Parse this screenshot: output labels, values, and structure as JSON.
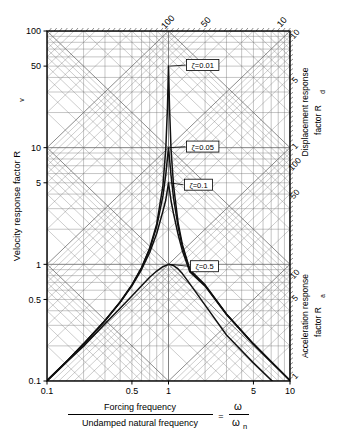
{
  "chart_data": {
    "type": "line",
    "title": "",
    "plot_kind": "tripartite-four-way-logarithmic-response-spectrum",
    "xlabel_numerator": "Forcing frequency",
    "xlabel_denominator": "Undamped  natural  frequency",
    "xlabel_equals": "=",
    "xlabel_ratio_num": "ω",
    "xlabel_ratio_den": "ω",
    "xlabel_ratio_den_sub": "n",
    "ylabel_left": "Velocity  response  factor  R",
    "ylabel_left_sub": "v",
    "ylabel_right_top": "Displacement  response",
    "ylabel_right_top2": "factor  R",
    "ylabel_right_top_sub": "d",
    "ylabel_right_bottom": "Acceleration  response",
    "ylabel_right_bottom2": "factor  R",
    "ylabel_right_bottom_sub": "a",
    "xlim": [
      0.1,
      10
    ],
    "ylim": [
      0.1,
      100
    ],
    "xscale": "log",
    "yscale": "log",
    "xticks": [
      "0.1",
      "0.5",
      "1",
      "5",
      "10"
    ],
    "xtick_values": [
      0.1,
      0.5,
      1,
      5,
      10
    ],
    "yticks": [
      "0.1",
      "0.5",
      "1",
      "5",
      "10",
      "50",
      "100"
    ],
    "ytick_values": [
      0.1,
      0.5,
      1,
      5,
      10,
      50,
      100
    ],
    "top_axis_ticks": [
      "100",
      "50",
      "10"
    ],
    "top_axis_tick_values": [
      100,
      50,
      10
    ],
    "right_axis_upper_ticks": [
      "10",
      "5",
      "1"
    ],
    "right_axis_upper_tick_values": [
      10,
      5,
      1
    ],
    "right_axis_mid_ticks": [
      "100",
      "50"
    ],
    "right_axis_mid_tick_values": [
      100,
      50
    ],
    "right_axis_lower_ticks": [
      "10",
      "5",
      "1"
    ],
    "right_axis_lower_tick_values": [
      10,
      5,
      1
    ],
    "grid": true,
    "grid_style": "four-way-logarithmic (horizontal, vertical, +45 and -45 diagonals)",
    "legend_position": "inline-annotations",
    "annotations": [
      {
        "text": "ζ=0.01",
        "x": 1.0,
        "y": 50
      },
      {
        "text": "ζ=0.05",
        "x": 1.0,
        "y": 10
      },
      {
        "text": "ζ=0.1",
        "x": 1.0,
        "y": 5
      },
      {
        "text": "ζ=0.5",
        "x": 1.0,
        "y": 1
      }
    ],
    "series": [
      {
        "name": "ζ=0.01",
        "damping_ratio": 0.01,
        "peak_x": 1.0,
        "peak_y": 50,
        "x": [
          0.1,
          0.15,
          0.2,
          0.3,
          0.4,
          0.5,
          0.6,
          0.7,
          0.8,
          0.9,
          0.95,
          0.98,
          1.0,
          1.02,
          1.05,
          1.1,
          1.2,
          1.3,
          1.5,
          2.0,
          3.0,
          5.0,
          7.0,
          10.0
        ],
        "y": [
          0.101,
          0.153,
          0.208,
          0.33,
          0.476,
          0.667,
          0.938,
          1.373,
          2.222,
          4.736,
          9.8,
          21.8,
          50.0,
          21.9,
          9.52,
          4.76,
          2.27,
          1.48,
          0.9,
          0.667,
          0.375,
          0.208,
          0.146,
          0.101
        ]
      },
      {
        "name": "ζ=0.05",
        "damping_ratio": 0.05,
        "peak_x": 1.0,
        "peak_y": 10,
        "x": [
          0.1,
          0.15,
          0.2,
          0.3,
          0.4,
          0.5,
          0.6,
          0.7,
          0.8,
          0.9,
          0.95,
          1.0,
          1.05,
          1.1,
          1.2,
          1.3,
          1.5,
          2.0,
          3.0,
          5.0,
          7.0,
          10.0
        ],
        "y": [
          0.101,
          0.152,
          0.208,
          0.329,
          0.475,
          0.664,
          0.929,
          1.345,
          2.108,
          3.861,
          5.88,
          10.0,
          5.74,
          3.7,
          2.1,
          1.42,
          0.88,
          0.66,
          0.374,
          0.208,
          0.146,
          0.101
        ]
      },
      {
        "name": "ζ=0.1",
        "damping_ratio": 0.1,
        "peak_x": 1.0,
        "peak_y": 5,
        "x": [
          0.1,
          0.15,
          0.2,
          0.3,
          0.4,
          0.5,
          0.6,
          0.7,
          0.8,
          0.9,
          0.95,
          1.0,
          1.05,
          1.1,
          1.2,
          1.3,
          1.5,
          2.0,
          3.0,
          5.0,
          7.0,
          10.0
        ],
        "y": [
          0.101,
          0.152,
          0.207,
          0.328,
          0.472,
          0.655,
          0.903,
          1.264,
          1.838,
          2.86,
          3.56,
          5.0,
          3.49,
          2.72,
          1.8,
          1.31,
          0.86,
          0.65,
          0.372,
          0.207,
          0.146,
          0.101
        ]
      },
      {
        "name": "ζ=0.5",
        "damping_ratio": 0.5,
        "peak_x": 1.0,
        "peak_y": 1.0,
        "x": [
          0.1,
          0.15,
          0.2,
          0.3,
          0.4,
          0.5,
          0.6,
          0.7,
          0.8,
          0.9,
          1.0,
          1.1,
          1.2,
          1.3,
          1.5,
          2.0,
          3.0,
          5.0,
          7.0,
          10.0
        ],
        "y": [
          0.1,
          0.15,
          0.199,
          0.309,
          0.42,
          0.535,
          0.655,
          0.774,
          0.876,
          0.954,
          1.0,
          0.976,
          0.913,
          0.833,
          0.68,
          0.447,
          0.248,
          0.143,
          0.102,
          0.0714
        ]
      }
    ]
  },
  "axis": {
    "left_ticks": [
      "100",
      "50",
      "10",
      "5",
      "1",
      "0.5",
      "0.1"
    ],
    "bottom_ticks": [
      "0.1",
      "0.5",
      "1",
      "5",
      "10"
    ],
    "top_ticks": [
      "100",
      "50",
      "10"
    ],
    "right_ticks_upper": [
      "10",
      "5",
      "1"
    ],
    "right_ticks_mid": [
      "100",
      "50"
    ],
    "right_ticks_lower": [
      "10",
      "5",
      "1"
    ]
  },
  "style": {
    "line_color": "#111111",
    "grid_color": "#777777",
    "frame_color": "#000000",
    "background": "#ffffff"
  }
}
